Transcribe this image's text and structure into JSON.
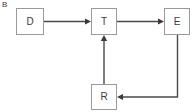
{
  "figure": {
    "panel_label": "B",
    "background_color": "#ffffff",
    "node_border_color": "#9a9a9a",
    "node_fill_color": "#ffffff",
    "edge_color": "#4a4a4a",
    "text_color": "#3c3c3c"
  },
  "nodes": [
    {
      "id": "D",
      "label": "D",
      "x": 16,
      "y": 8,
      "width": 28,
      "height": 27
    },
    {
      "id": "T",
      "label": "T",
      "x": 91,
      "y": 8,
      "width": 26,
      "height": 27
    },
    {
      "id": "E",
      "label": "E",
      "x": 164,
      "y": 8,
      "width": 26,
      "height": 27
    },
    {
      "id": "R",
      "label": "R",
      "x": 91,
      "y": 84,
      "width": 26,
      "height": 26
    }
  ],
  "edges": [
    {
      "id": "D-to-T",
      "from": "D",
      "to": "T",
      "direction": "right",
      "style": "solid-arrow"
    },
    {
      "id": "T-to-E",
      "from": "T",
      "to": "E",
      "direction": "right",
      "style": "solid-arrow"
    },
    {
      "id": "E-to-R",
      "from": "E",
      "to": "R",
      "direction": "down-then-left",
      "style": "solid-arrow"
    },
    {
      "id": "R-to-T",
      "from": "R",
      "to": "T",
      "direction": "up",
      "style": "solid-arrow"
    }
  ]
}
